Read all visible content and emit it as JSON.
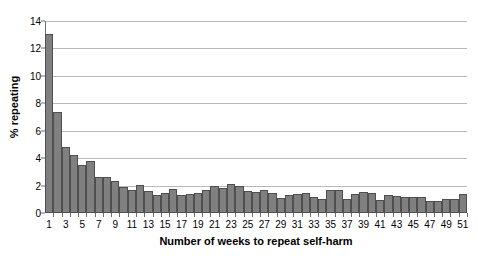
{
  "chart_data": {
    "type": "bar",
    "title": "",
    "xlabel": "Number of weeks to repeat self-harm",
    "ylabel": "% repeating",
    "ylim": [
      0,
      14
    ],
    "ytick_step": 2,
    "yticks": [
      0,
      2,
      4,
      6,
      8,
      10,
      12,
      14
    ],
    "grid": true,
    "legend": false,
    "legend_position": "none",
    "bar_color": "#808080",
    "bar_edge_color": "#4f4f4f",
    "plot_background": "#ffffff",
    "gridline_color": "#b9b9b9",
    "axis_color": "#6e6e6e",
    "categories": [
      1,
      2,
      3,
      4,
      5,
      6,
      7,
      8,
      9,
      10,
      11,
      12,
      13,
      14,
      15,
      16,
      17,
      18,
      19,
      20,
      21,
      22,
      23,
      24,
      25,
      26,
      27,
      28,
      29,
      30,
      31,
      32,
      33,
      34,
      35,
      36,
      37,
      38,
      39,
      40,
      41,
      42,
      43,
      44,
      45,
      46,
      47,
      48,
      49,
      50,
      51
    ],
    "xtick_labels": [
      1,
      3,
      5,
      7,
      9,
      11,
      13,
      15,
      17,
      19,
      21,
      23,
      25,
      27,
      29,
      31,
      33,
      35,
      37,
      39,
      41,
      43,
      45,
      47,
      49,
      51
    ],
    "values": [
      13.05,
      7.35,
      4.85,
      4.25,
      3.5,
      3.8,
      2.65,
      2.6,
      2.35,
      1.9,
      1.7,
      2.05,
      1.6,
      1.3,
      1.45,
      1.75,
      1.35,
      1.4,
      1.45,
      1.7,
      2.0,
      1.85,
      2.1,
      2.0,
      1.6,
      1.55,
      1.7,
      1.45,
      1.1,
      1.35,
      1.4,
      1.45,
      1.2,
      1.0,
      1.65,
      1.7,
      1.0,
      1.4,
      1.55,
      1.45,
      0.95,
      1.3,
      1.25,
      1.2,
      1.2,
      1.2,
      0.85,
      0.9,
      1.0,
      1.0,
      1.4
    ]
  }
}
